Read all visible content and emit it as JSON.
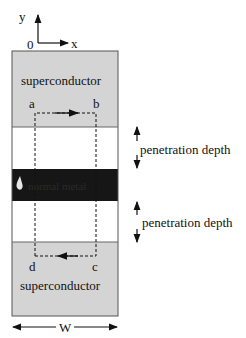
{
  "axes": {
    "y_label": "y",
    "x_label": "x",
    "origin_label": "0"
  },
  "regions": {
    "top": {
      "label": "superconductor",
      "color": "#d4d4d4"
    },
    "gap_top": {
      "color": "#ffffff"
    },
    "barrier": {
      "label": "normal metal",
      "color": "#161616"
    },
    "gap_bottom": {
      "color": "#ffffff"
    },
    "bottom": {
      "label": "superconductor",
      "color": "#d4d4d4"
    }
  },
  "loop": {
    "corners": [
      "a",
      "b",
      "c",
      "d"
    ]
  },
  "annotations": {
    "penetration_top": "penetration depth",
    "penetration_bottom": "penetration depth",
    "width_label": "W"
  }
}
